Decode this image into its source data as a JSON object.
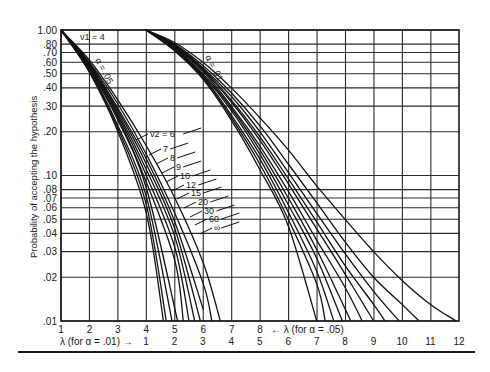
{
  "chart_data": {
    "type": "line",
    "title": "",
    "panel_label": "ν1 = 4",
    "ylabel": "Probability of accepting the hypothesis",
    "xlabel_top": "← λ (for α = .05)",
    "xlabel_bottom": "λ (for α = .01) →",
    "yscale": "log",
    "ylim": [
      0.01,
      1.0
    ],
    "y_ticks": [
      1.0,
      0.8,
      0.7,
      0.6,
      0.5,
      0.4,
      0.3,
      0.2,
      0.1,
      0.08,
      0.07,
      0.06,
      0.05,
      0.04,
      0.03,
      0.02,
      0.01
    ],
    "y_tick_labels": [
      "1.00",
      ".80",
      ".70",
      ".60",
      ".50",
      ".40",
      ".30",
      ".20",
      ".10",
      ".08",
      ".07",
      ".06",
      ".05",
      ".04",
      ".03",
      ".02",
      ".01"
    ],
    "x_ticks_alpha_05": [
      "1",
      "2",
      "3",
      "4",
      "5",
      "6",
      "7",
      "8"
    ],
    "x_ticks_alpha_01": [
      "1",
      "2",
      "3",
      "4",
      "5",
      "6",
      "7",
      "8",
      "9",
      "10",
      "11",
      "12"
    ],
    "family_labels": {
      "alpha_05": "α = .05",
      "alpha_01": "α = .01"
    },
    "nu2_labels": [
      "ν2 = 6",
      "7",
      "8",
      "9",
      "10",
      "12",
      "15",
      "20",
      "30",
      "60",
      "∞"
    ],
    "grid": true,
    "series": [
      {
        "name": "α=.05, ν2=6",
        "lambda": [
          1,
          2,
          3,
          4,
          5,
          6,
          6.6
        ],
        "P": [
          1.0,
          0.62,
          0.33,
          0.16,
          0.07,
          0.025,
          0.01
        ]
      },
      {
        "name": "α=.05, ν2=7",
        "lambda": [
          1,
          2,
          3,
          4,
          5,
          6,
          6.3
        ],
        "P": [
          1.0,
          0.6,
          0.31,
          0.14,
          0.055,
          0.018,
          0.01
        ]
      },
      {
        "name": "α=.05, ν2=8",
        "lambda": [
          1,
          2,
          3,
          4,
          5,
          6.0
        ],
        "P": [
          1.0,
          0.59,
          0.29,
          0.13,
          0.048,
          0.012
        ]
      },
      {
        "name": "α=.05, ν2=9",
        "lambda": [
          1,
          2,
          3,
          4,
          5,
          5.9
        ],
        "P": [
          1.0,
          0.58,
          0.28,
          0.12,
          0.043,
          0.01
        ]
      },
      {
        "name": "α=.05, ν2=10",
        "lambda": [
          1,
          2,
          3,
          4,
          5,
          5.7
        ],
        "P": [
          1.0,
          0.57,
          0.27,
          0.11,
          0.038,
          0.01
        ]
      },
      {
        "name": "α=.05, ν2=12",
        "lambda": [
          1,
          2,
          3,
          4,
          5,
          5.5
        ],
        "P": [
          1.0,
          0.56,
          0.26,
          0.1,
          0.032,
          0.01
        ]
      },
      {
        "name": "α=.05, ν2=15",
        "lambda": [
          1,
          2,
          3,
          4,
          5,
          5.3
        ],
        "P": [
          1.0,
          0.55,
          0.25,
          0.09,
          0.026,
          0.01
        ]
      },
      {
        "name": "α=.05, ν2=20",
        "lambda": [
          1,
          2,
          3,
          4,
          5.1
        ],
        "P": [
          1.0,
          0.54,
          0.24,
          0.082,
          0.01
        ]
      },
      {
        "name": "α=.05, ν2=30",
        "lambda": [
          1,
          2,
          3,
          4,
          4.9
        ],
        "P": [
          1.0,
          0.53,
          0.22,
          0.072,
          0.01
        ]
      },
      {
        "name": "α=.05, ν2=60",
        "lambda": [
          1,
          2,
          3,
          4,
          4.7
        ],
        "P": [
          1.0,
          0.52,
          0.21,
          0.063,
          0.01
        ]
      },
      {
        "name": "α=.05, ν2=∞",
        "lambda": [
          1,
          2,
          3,
          4,
          4.6
        ],
        "P": [
          1.0,
          0.51,
          0.2,
          0.055,
          0.01
        ]
      },
      {
        "name": "α=.01, ν2=6",
        "lambda": [
          1,
          2,
          3,
          4,
          5,
          6,
          7,
          8,
          9,
          10,
          11,
          11.9
        ],
        "P": [
          1.0,
          0.82,
          0.6,
          0.4,
          0.25,
          0.15,
          0.085,
          0.05,
          0.03,
          0.019,
          0.013,
          0.01
        ]
      },
      {
        "name": "α=.01, ν2=7",
        "lambda": [
          1,
          2,
          3,
          4,
          5,
          6,
          7,
          8,
          9,
          10,
          10.6
        ],
        "P": [
          1.0,
          0.8,
          0.57,
          0.37,
          0.22,
          0.12,
          0.065,
          0.035,
          0.02,
          0.013,
          0.01
        ]
      },
      {
        "name": "α=.01, ν2=8",
        "lambda": [
          1,
          2,
          3,
          4,
          5,
          6,
          7,
          8,
          9,
          9.9
        ],
        "P": [
          1.0,
          0.79,
          0.55,
          0.35,
          0.2,
          0.105,
          0.055,
          0.029,
          0.016,
          0.01
        ]
      },
      {
        "name": "α=.01, ν2=9",
        "lambda": [
          1,
          2,
          3,
          4,
          5,
          6,
          7,
          8,
          9,
          9.4
        ],
        "P": [
          1.0,
          0.78,
          0.54,
          0.33,
          0.185,
          0.095,
          0.048,
          0.024,
          0.013,
          0.01
        ]
      },
      {
        "name": "α=.01, ν2=10",
        "lambda": [
          1,
          2,
          3,
          4,
          5,
          6,
          7,
          8,
          9.0
        ],
        "P": [
          1.0,
          0.78,
          0.53,
          0.32,
          0.175,
          0.088,
          0.043,
          0.021,
          0.01
        ]
      },
      {
        "name": "α=.01, ν2=12",
        "lambda": [
          1,
          2,
          3,
          4,
          5,
          6,
          7,
          8,
          8.6
        ],
        "P": [
          1.0,
          0.77,
          0.52,
          0.3,
          0.16,
          0.078,
          0.036,
          0.017,
          0.01
        ]
      },
      {
        "name": "α=.01, ν2=15",
        "lambda": [
          1,
          2,
          3,
          4,
          5,
          6,
          7,
          8.2
        ],
        "P": [
          1.0,
          0.76,
          0.5,
          0.29,
          0.15,
          0.07,
          0.031,
          0.01
        ]
      },
      {
        "name": "α=.01, ν2=20",
        "lambda": [
          1,
          2,
          3,
          4,
          5,
          6,
          7,
          7.9
        ],
        "P": [
          1.0,
          0.75,
          0.49,
          0.28,
          0.14,
          0.063,
          0.027,
          0.01
        ]
      },
      {
        "name": "α=.01, ν2=30",
        "lambda": [
          1,
          2,
          3,
          4,
          5,
          6,
          7,
          7.6
        ],
        "P": [
          1.0,
          0.74,
          0.48,
          0.26,
          0.13,
          0.056,
          0.022,
          0.01
        ]
      },
      {
        "name": "α=.01, ν2=60",
        "lambda": [
          1,
          2,
          3,
          4,
          5,
          6,
          7,
          7.3
        ],
        "P": [
          1.0,
          0.73,
          0.47,
          0.25,
          0.12,
          0.05,
          0.018,
          0.01
        ]
      },
      {
        "name": "α=.01, ν2=∞",
        "lambda": [
          1,
          2,
          3,
          4,
          5,
          6,
          7.0
        ],
        "P": [
          1.0,
          0.72,
          0.46,
          0.24,
          0.11,
          0.045,
          0.01
        ]
      }
    ]
  }
}
